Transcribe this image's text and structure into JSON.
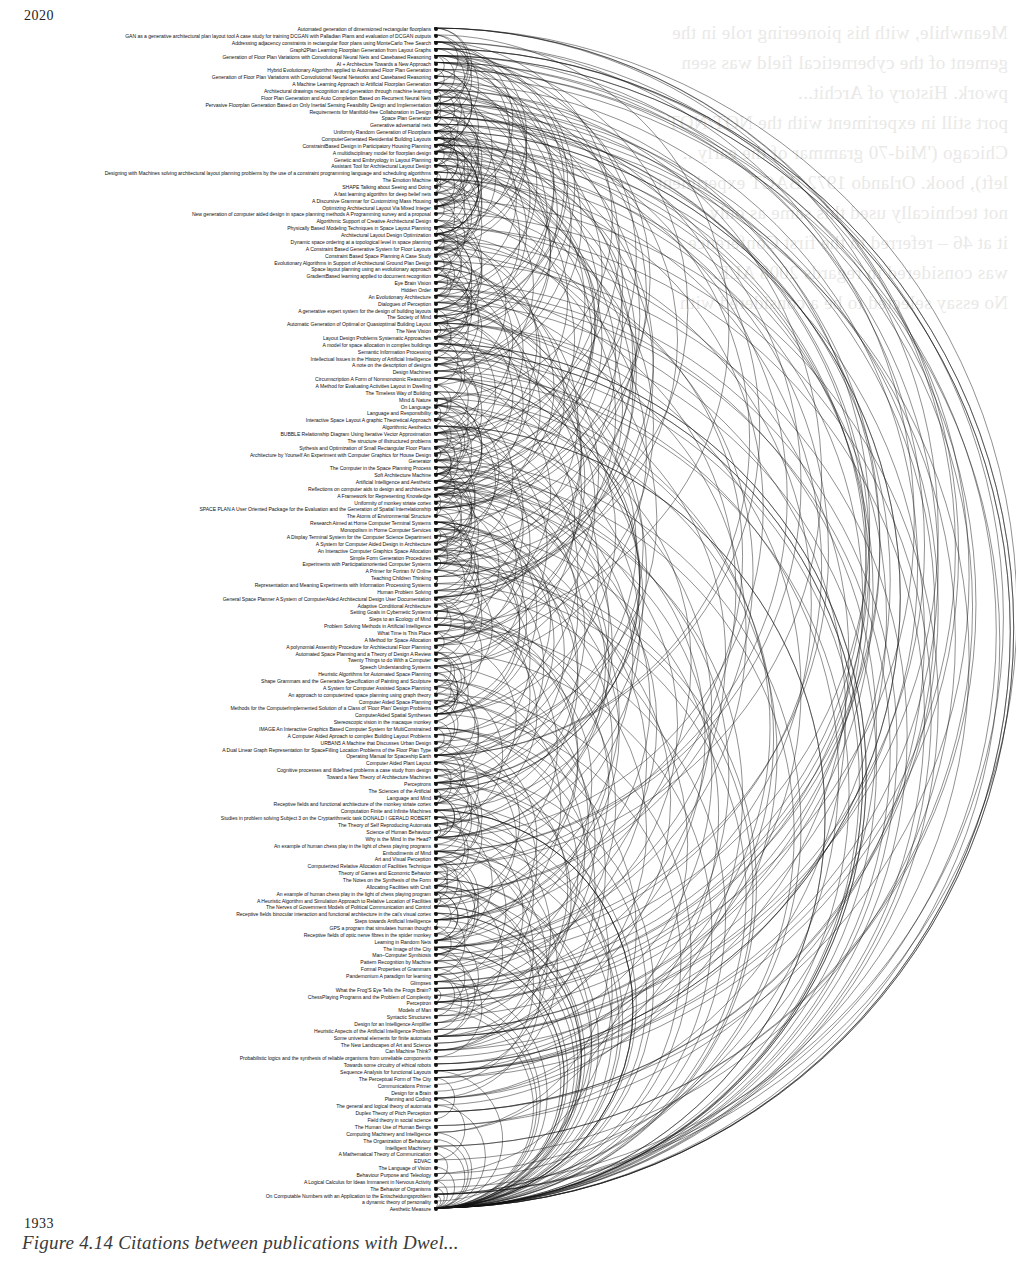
{
  "figure": {
    "caption": "Figure 4.14   Citations between publications with Dwel...",
    "year_top": "2020",
    "year_bottom": "1933"
  },
  "bleed_text": [
    "Meanwhile, with his pioneering role in the",
    "gement of the cybernetical field was seen",
    "pwork. History of Archit...",
    "port still in experiment with the NOT/NOT",
    "Chicago ('Mid-70 grammar of the early ..",
    "left), book. Orlando 1972 BACT experiment",
    "not technically used this same as only",
    "it at 46 – referred to the first Conference",
    "was considered in regards 2008 ALE.",
    "No essay selected to be a considered with"
  ],
  "chart_data": {
    "type": "arc-diagram",
    "axis": {
      "orientation": "vertical",
      "top_label": "2020",
      "bottom_label": "1933",
      "direction": "newest-at-top"
    },
    "arc_side": "right",
    "node_count": 183,
    "nodes": [
      "Automated generation of dimensioned rectangular floorplans",
      "GAN as a generative architectural plan layout tool A case study for training DCGAN with Palladian Plans and evaluation of DCGAN outputs",
      "Addressing adjacency constraints in rectangular floor plans using MonteCarlo Tree Search",
      "Graph2Plan Learning Floorplan Generation from Layout Graphs",
      "Generation of Floor Plan Variations with Convolutional Neural Nets and Casebased Reasoning",
      "AI + Architecture Towards a New Approach",
      "Hybrid Evolutionary Algorithm applied to Automated Floor Plan Generation",
      "Generation of Floor Plan Variations with Convolutional Neural Networks and Casebased Reasoning",
      "A Machine Learning Approach to Artificial Floorplan Generation",
      "Architectural drawings recognition and generation through machine learning",
      "Floor Plan Generation and Auto Completion Based on Recurrent Neural Nets",
      "Pervasive Floorplan Generation Based on Only Inertial Sensing Feasibility Design and Implementation",
      "Requirements for Manifold‑free Collaboration in Design",
      "Space Plan Generator",
      "Generative adversarial nets",
      "Uniformly Random Generation of Floorplans",
      "ComputerGenerated Residential Building Layouts",
      "ConstraintBased Design in Participatory Housing Planning",
      "A multidisciplinary model for floorplan design",
      "Genetic and Embryology in Layout Planning",
      "Assistant Tool for Architectural Layout Design",
      "Designing with Machines solving architectural layout planning problems by the use of a constraint programming language and scheduling algorithms",
      "The Emotion Machine",
      "SHAPE Talking about Seeing and Doing",
      "A fast learning algorithm for deep belief nets",
      "A Discursive Grammar for Customizing Mass Housing",
      "Optimizing Architectural Layout Via Mixed Integer",
      "New generation of computer aided design in space planning methods A Programming survey and a proposal",
      "Algorithmic Support of Creative Architectural Design",
      "Physically Based Modeling Techniques in Space Layout Planning",
      "Architectural Layout Design Optimization",
      "Dynamic space ordering at a topological level in space planning",
      "A Constraint Based Generative System for Floor Layouts",
      "Constraint Based Space Planning A Case Study",
      "Evolutionary Algorithms in Support of Architectural Ground Plan Design",
      "Space layout planning using an evolutionary approach",
      "GradientBased learning applied to document recognition",
      "Eye Brain Vision",
      "Hidden Order",
      "An Evolutionary Architecture",
      "Dialogues of Perception",
      "A generative expert system for the design of building layouts",
      "The Society of Mind",
      "Automatic Generation of Optimal or Quasioptimal Building Layout",
      "The New Vision",
      "Layout Design Problems Systematic Approaches",
      "A model for space allocation in complex buildings",
      "Semantic Information Processing",
      "Intellectual Issues in the History of Artificial Intelligence",
      "A note on the description of designs",
      "Design Machines",
      "Circumscription A Form of Nonmonotonic Reasoning",
      "A Method for Evaluating Activities Layout in Dwelling",
      "The Timeless Way of Building",
      "Mind & Nature",
      "On Language",
      "Language and Responsibility",
      "Interactive Space Layout A graphic Theoretical Approach",
      "Algorithmic Aesthetics",
      "BUBBLE Relationship Diagram Using Iterative Vector Approximation",
      "The structure of illstructured problems",
      "Sythesis and Optimization of Small Rectangular Floor Plans",
      "Architecture by Yourself An Experiment with Computer Graphics for House Design",
      "Generator",
      "The Computer in the Space Planning Process",
      "Soft Architecture Machine",
      "Artificial Intelligence and Aesthetic",
      "Reflections on computer aids to design and architecture",
      "A Framework for Representing Knowledge",
      "Uniformity of monkey striate cortex",
      "SPACE PLAN A User Oriented Package for the Evaluation and the Generation of Spatial Interrelationship",
      "The Atoms of Environmental Structure",
      "Research Aimed at Home Computer Terminal Systems",
      "Monopolism in Home Computer Services",
      "A Display Terminal System for the Computer Science Department",
      "A System for Computer Aided Design in Architecture",
      "An Interactive Computer Graphics Space Allocation",
      "Simple Form Generation Procedures",
      "Experiments with Participationoriented Computer Systems",
      "A Primer for Fortran IV Online",
      "Teaching Children Thinking",
      "Representation and Meaning Experiments with Information Processing Systems",
      "Human Problem Solving",
      "General Space Planner A System of ComputerAided Architectural Design User Documentation",
      "Adaptive Conditional Architecture",
      "Setting Goals in Cybernetic Systems",
      "Steps to an Ecology of Mind",
      "Problem Solving Methods in Artificial Intelligence",
      "What Time is This Place",
      "A Method for Space Allocation",
      "A polynomial Assembly Procedure for Architectural Floor Planning",
      "Automated Space Planning and a Theory of Design A Review",
      "Twenty Things to do With a Computer",
      "Speech Understanding Systems",
      "Heuristic Algorithms for Automated Space Planning",
      "Shape Grammars and the Generative Specification of Painting and Sculpture",
      "A System for Computer Assisted Space Planning",
      "An approach to computerized space planning using graph theory",
      "Computer Aided Space Planning",
      "Methods for the ComputerImplemented Solution of a Class of 'Floor Plan' Design Problems",
      "ComputerAided Spatial Syntheses",
      "Stereoscopic vision in the macaque monkey",
      "IMAGE An Interactive Graphics Based Computer System for MultiConstrained",
      "A Computer Aided Aproach to complex Building Layout Problems",
      "URBAN5 A Machine that Discusses Urban Design",
      "A Dual Linear Graph Representation for SpaceFilling Location Problems of the Floor Plan Type",
      "Operating Manual for Spaceship Earth",
      "Computer Aided Plant Layout",
      "Cognitive processes and illdefined problems a case study from design",
      "Toward a New Theory of Architecture Machines",
      "Perceptrons",
      "The Sciences of the Artificial",
      "Language and Mind",
      "Receptive fields and functional architecture of the monkey striate cortex",
      "Computation Finite and Infinite Machines",
      "Studies in problem solving Subject 3 on the Cryptarithmetic task DONALD I GERALD ROBERT",
      "The Theory of Self Reproducing Automata",
      "Science of Human Behaviour",
      "Why is the Mind In the Head?",
      "An example of human chess play in the light of chess playing programs",
      "Embodiments of Mind",
      "Art and Visual Perception",
      "Computerized Relative Allocation of Facilities Technique",
      "Theory of Games and Economic Behavior",
      "The Notes on the Synthesis of the Form",
      "Allocating Facilities with Craft",
      "An example of human chess play in the light of chess playing program",
      "A Heuristic Algorithm and Simulation Approach to Relative Location of Facilities",
      "The Nerves of Government Models of Political Communication and Control",
      "Receptive fields binocular interaction and functional architecture in the cat's visual cortex",
      "Steps towards Artificial Intelligence",
      "GPS a program that simulates human thought",
      "Receptive fields of optic nerve fibres in the spider monkey",
      "Learning in Random Nets",
      "The Image of the City",
      "Man–Computer Symbiosis",
      "Pattern Recognition by Machine",
      "Formal Properties of Grammars",
      "Pandemonium A paradigm for learning",
      "Glimpses",
      "What the Frog'S Eye Tells the Frogs Brain?",
      "ChessPlaying Programs and the Problem of Complexity",
      "Perceptron",
      "Models of Man",
      "Syntactic Structures",
      "Design for an Intelligence Amplifier",
      "Heuristic Aspects of the Artificial Intelligence Problem",
      "Some universal elements for finite automata",
      "The New Landscapes of Art and Science",
      "Can Machine Think?",
      "Probabilistic logics and the synthesis of reliable organisms from unreliable components",
      "Towards some circuitry of ethical robots",
      "Sequence Analysis for functional Layouts",
      "The Perceptual Form of The City",
      "Communications Primer",
      "Design for a Brain",
      "Planning and Coding",
      "The general and logical theory of automata",
      "Duplex Theory of Pitch Perception",
      "Field theory in social science",
      "The Human Use of Human Beings",
      "Computing Machinery and Intelligence",
      "The Organization of Behaviour",
      "Intelligent Machinery",
      "A Mathematical Theory of Communication",
      "EDVAC",
      "The Language of Vision",
      "Behaviour Purpose and Teleology",
      "A Logical Calculus for Ideas Immanent in Nervous Activity",
      "The Behavior of Organisms",
      "On Computable Numbers with an Application to the Entscheidungsproblem",
      "a dynamic theory of personality",
      "Aesthetic Measure"
    ],
    "edges_description": "Right-side semicircular arcs connecting each citing publication (upper node) to the publication it cites (lower node); arc radius proportional to citation time span.",
    "colors": {
      "node": "#111111",
      "arc": "#111111",
      "label": "#111111",
      "background": "#ffffff"
    }
  }
}
